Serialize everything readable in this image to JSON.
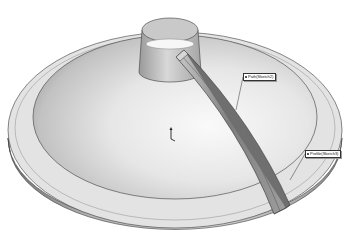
{
  "viewport": {
    "model": "swept rib on conical dome with flange and neck",
    "render_style": "grayscale shaded with edges"
  },
  "callouts": [
    {
      "label": "Path(Sketch2)",
      "icon": "sketch-bullet-icon"
    },
    {
      "label": "Profile(Sketch3)",
      "icon": "sketch-bullet-icon"
    }
  ],
  "origin_triad": {
    "icon": "origin-axis-icon"
  },
  "colors": {
    "background": "#ffffff",
    "flange_top": "#e4e4e4",
    "flange_side": "#9a9a9a",
    "dome_light": "#f2f2f2",
    "dome_dark": "#a8a8a8",
    "rib": "#8f8f8f",
    "edge": "#3a3a3a"
  }
}
